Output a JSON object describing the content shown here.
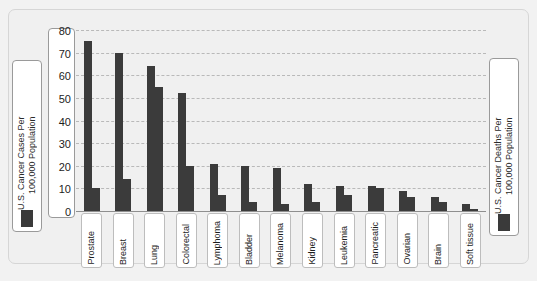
{
  "chart_data": {
    "type": "bar",
    "title": "",
    "xlabel": "",
    "ylabel": "",
    "ylim": [
      0,
      80
    ],
    "yticks": [
      80,
      70,
      60,
      50,
      40,
      30,
      20,
      10,
      0
    ],
    "grid": true,
    "legend_position": "sides",
    "categories": [
      "Prostate",
      "Breast",
      "Lung",
      "Colorectal",
      "Lymphoma",
      "Bladder",
      "Melanoma",
      "Kidney",
      "Leukemia",
      "Pancreatic",
      "Ovarian",
      "Brain",
      "Soft tissue"
    ],
    "series": [
      {
        "name": "U.S. Cancer Cases Per 100,000 Population",
        "values": [
          75,
          70,
          64,
          52,
          21,
          20,
          19,
          12,
          11,
          11,
          9,
          6,
          3
        ],
        "color": "#3b3b3b"
      },
      {
        "name": "U.S. Cancer Deaths Per 100,000 Population",
        "values": [
          10,
          14,
          55,
          20,
          7,
          4,
          3,
          4,
          7,
          10,
          6,
          4,
          1
        ],
        "color": "#3b3b3b"
      }
    ]
  },
  "legend": {
    "left": {
      "label": "U.S. Cancer Cases Per\n100,000 Population",
      "swatch_color": "#3b3b3b"
    },
    "right": {
      "label": "U.S. Cancer Deaths Per\n100,000 Population",
      "swatch_color": "#3b3b3b"
    }
  },
  "colors": {
    "bar": "#3b3b3b",
    "grid": "#b9b9b9",
    "panel_background": "#f0f0f0",
    "figure_background": "#f2f2f2",
    "box_border": "#9a9a9a",
    "text": "#1d1d1d"
  }
}
